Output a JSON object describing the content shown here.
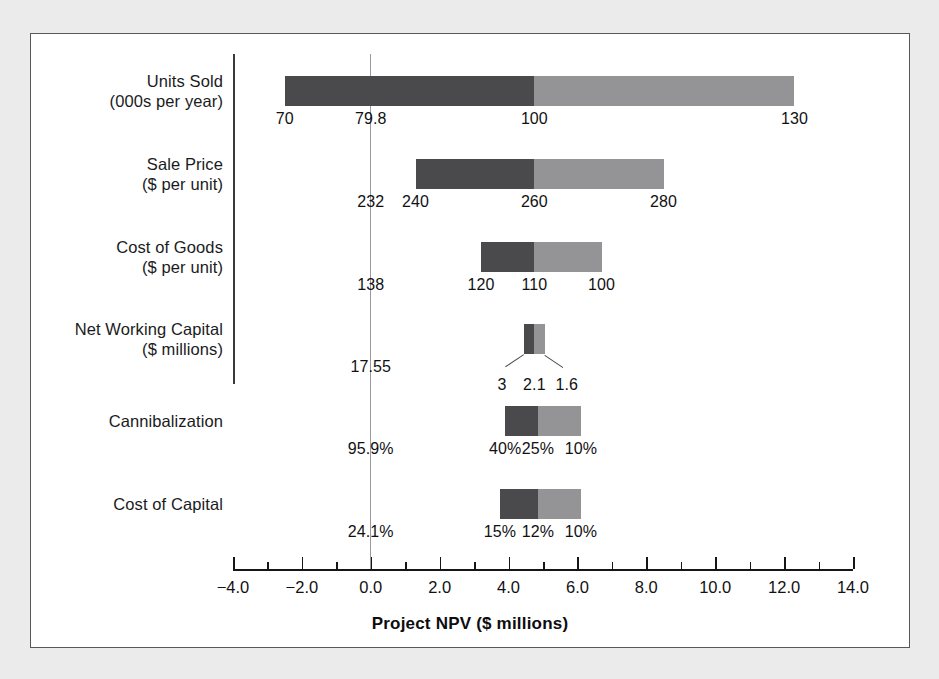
{
  "figure": {
    "background": "#ebebeb",
    "plate": "#ffffff",
    "frame_color": "#58585a",
    "down_color": "#4a4a4c",
    "up_color": "#949496",
    "zero_line_color": "#9a9a9c"
  },
  "chart_data": {
    "type": "bar",
    "subtype": "tornado",
    "title": "",
    "xlabel": "Project NPV ($ millions)",
    "ylabel": "",
    "xlim": [
      -4.0,
      14.0
    ],
    "grid": false,
    "legend": "none",
    "xticks": [
      -4.0,
      -2.0,
      0.0,
      2.0,
      4.0,
      6.0,
      8.0,
      10.0,
      12.0,
      14.0
    ],
    "xticklabels": [
      "−4.0",
      "−2.0",
      "0.0",
      "2.0",
      "4.0",
      "6.0",
      "8.0",
      "10.0",
      "12.0",
      "14.0"
    ],
    "minor_tick_step": 1.0,
    "zero_line": 0.0,
    "categories": [
      "Units Sold (000s per year)",
      "Sale Price ($ per unit)",
      "Cost of Goods ($ per unit)",
      "Net Working Capital ($ millions)",
      "Cannibalization",
      "Cost of Capital"
    ],
    "bars": [
      {
        "category": "Units Sold",
        "npv_low": -2.5,
        "npv_base": 4.75,
        "npv_high": 12.3,
        "label_low": "70",
        "label_base": "100",
        "label_high": "130",
        "breakeven_label": "79.8",
        "breakeven_npv": 0.0
      },
      {
        "category": "Sale Price",
        "npv_low": 1.3,
        "npv_base": 4.75,
        "npv_high": 8.5,
        "label_low": "240",
        "label_base": "260",
        "label_high": "280",
        "breakeven_label": "232",
        "breakeven_npv": 0.0
      },
      {
        "category": "Cost of Goods",
        "npv_low": 3.2,
        "npv_base": 4.75,
        "npv_high": 6.7,
        "label_low": "120",
        "label_base": "110",
        "label_high": "100",
        "breakeven_label": "138",
        "breakeven_npv": 0.0
      },
      {
        "category": "Net Working Capital",
        "npv_low": 4.45,
        "npv_base": 4.75,
        "npv_high": 5.05,
        "label_low": "3",
        "label_base": "2.1",
        "label_high": "1.6",
        "breakeven_label": "17.55",
        "breakeven_npv": 0.0
      },
      {
        "category": "Cannibalization",
        "npv_low": 3.9,
        "npv_base": 4.85,
        "npv_high": 6.1,
        "label_low": "40%",
        "label_base": "25%",
        "label_high": "10%",
        "breakeven_label": "95.9%",
        "breakeven_npv": 0.0
      },
      {
        "category": "Cost of Capital",
        "npv_low": 3.75,
        "npv_base": 4.85,
        "npv_high": 6.1,
        "label_low": "15%",
        "label_base": "12%",
        "label_high": "10%",
        "breakeven_label": "24.1%",
        "breakeven_npv": 0.0
      }
    ]
  },
  "rows": [
    {
      "label_line1": "Units Sold",
      "label_line2": "(000s per year)",
      "breakeven": "79.8",
      "low": "70",
      "base": "100",
      "high": "130"
    },
    {
      "label_line1": "Sale Price",
      "label_line2": "($ per unit)",
      "breakeven": "232",
      "low": "240",
      "base": "260",
      "high": "280"
    },
    {
      "label_line1": "Cost of Goods",
      "label_line2": "($ per unit)",
      "breakeven": "138",
      "low": "120",
      "base": "110",
      "high": "100"
    },
    {
      "label_line1": "Net Working Capital",
      "label_line2": "($ millions)",
      "breakeven": "17.55",
      "low": "3",
      "base": "2.1",
      "high": "1.6"
    },
    {
      "label_line1": "Cannibalization",
      "label_line2": "",
      "breakeven": "95.9%",
      "low": "40%",
      "base": "25%",
      "high": "10%"
    },
    {
      "label_line1": "Cost of Capital",
      "label_line2": "",
      "breakeven": "24.1%",
      "low": "15%",
      "base": "12%",
      "high": "10%"
    }
  ],
  "axis": {
    "title": "Project NPV ($ millions)",
    "ticks": [
      "−4.0",
      "−2.0",
      "0.0",
      "2.0",
      "4.0",
      "6.0",
      "8.0",
      "10.0",
      "12.0",
      "14.0"
    ]
  }
}
